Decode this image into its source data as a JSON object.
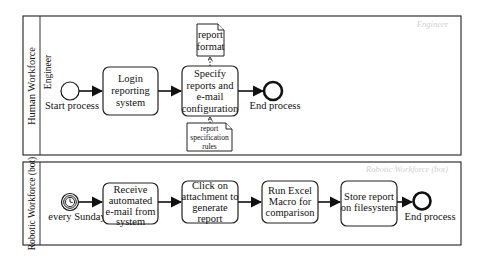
{
  "diagram": {
    "type": "BPMN collaboration",
    "pools": [
      {
        "label": "Human Workforce",
        "lane_label": "Engineer",
        "watermark": "Engineer",
        "start_event": {
          "label": "Start process",
          "type": "none"
        },
        "tasks": [
          {
            "lines": [
              "Login",
              "reporting",
              "system"
            ]
          },
          {
            "lines": [
              "Specify",
              "reports and",
              "e-mail",
              "configuration"
            ]
          }
        ],
        "data_objects": [
          {
            "lines": [
              "report",
              "format"
            ],
            "direction": "output"
          },
          {
            "lines": [
              "report",
              "specification",
              "rules"
            ],
            "direction": "input"
          }
        ],
        "end_event": {
          "label": "End process"
        }
      },
      {
        "label": "Robotic Workforce (bot)",
        "watermark": "Robotic Workforce (bot)",
        "start_event": {
          "label": "every Sunday",
          "type": "timer"
        },
        "tasks": [
          {
            "lines": [
              "Receive",
              "automated",
              "e-mail from",
              "system"
            ]
          },
          {
            "lines": [
              "Click on",
              "attachment to",
              "generate",
              "report"
            ]
          },
          {
            "lines": [
              "Run Excel",
              "Macro for",
              "comparison"
            ]
          },
          {
            "lines": [
              "Store report",
              "on filesystem"
            ]
          }
        ],
        "end_event": {
          "label": "End process"
        }
      }
    ]
  }
}
